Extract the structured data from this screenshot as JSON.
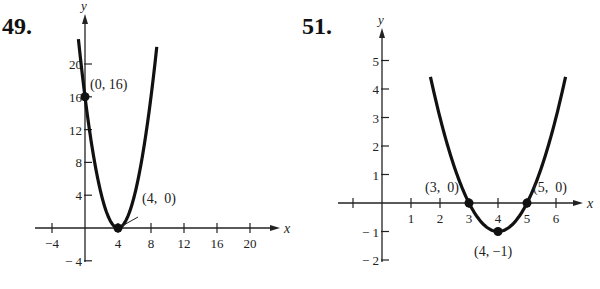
{
  "problems": [
    {
      "number": "49.",
      "x_label": "x",
      "y_label": "y"
    },
    {
      "number": "51.",
      "x_label": "x",
      "y_label": "y"
    }
  ],
  "chart_data": [
    {
      "type": "line",
      "title": "49.",
      "xlabel": "x",
      "ylabel": "y",
      "function": "y = (x - 4)^2",
      "x_ticks": [
        -4,
        4,
        8,
        12,
        16,
        20
      ],
      "x_tick_labels": [
        "−4",
        "4",
        "8",
        "12",
        "16",
        "20"
      ],
      "y_ticks": [
        -4,
        4,
        8,
        12,
        16,
        20
      ],
      "y_tick_labels": [
        "− 4",
        "4",
        "8",
        "12",
        "16",
        "20"
      ],
      "xlim": [
        -5,
        24
      ],
      "ylim": [
        -5,
        24
      ],
      "grid": false,
      "points": [
        {
          "x": 0,
          "y": 16,
          "label": "(0, 16)"
        },
        {
          "x": 4,
          "y": 0,
          "label": "(4,  0)"
        }
      ]
    },
    {
      "type": "line",
      "title": "51.",
      "xlabel": "x",
      "ylabel": "y",
      "function": "y = (x - 4)^2 - 1",
      "x_ticks": [
        -1,
        1,
        2,
        3,
        4,
        5,
        6
      ],
      "x_tick_labels": [
        "",
        "1",
        "2",
        "3",
        "4",
        "5",
        "6"
      ],
      "y_ticks": [
        -2,
        -1,
        1,
        2,
        3,
        4,
        5
      ],
      "y_tick_labels": [
        "− 2",
        "− 1",
        "1",
        "2",
        "3",
        "4",
        "5"
      ],
      "xlim": [
        -1.5,
        7
      ],
      "ylim": [
        -2.5,
        6
      ],
      "grid": false,
      "points": [
        {
          "x": 3,
          "y": 0,
          "label": "(3,  0)"
        },
        {
          "x": 5,
          "y": 0,
          "label": "(5,  0)"
        },
        {
          "x": 4,
          "y": -1,
          "label": "(4, −1)"
        }
      ]
    }
  ]
}
